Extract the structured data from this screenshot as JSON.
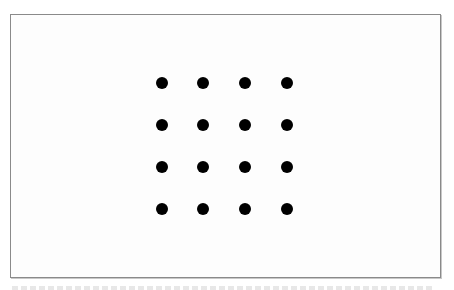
{
  "figure": {
    "border_color": "#8a8a8a",
    "background_color": "#fdfdfd",
    "dot_color": "#000000",
    "grid": {
      "rows": 4,
      "cols": 4,
      "dot_diameter_px": 12,
      "col_centers_px": [
        162,
        203,
        245,
        287
      ],
      "row_centers_px": [
        83,
        125,
        167,
        209
      ],
      "total_dots": 16
    }
  }
}
